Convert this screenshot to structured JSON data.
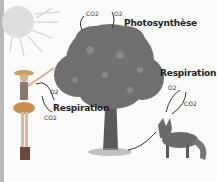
{
  "labels": {
    "photosynthesis": "Photosynthèse",
    "respiration_human": "Respiration",
    "respiration_fox": "Respiration"
  },
  "gases": {
    "tree_in": "CO2",
    "tree_out": "O2",
    "human_in": "O2",
    "human_out": "CO2",
    "fox_in": "O2",
    "fox_out": "CO2"
  },
  "colors": {
    "background": "#fbfbfb",
    "foliage": "#6f6f6f",
    "trunk": "#5a5a5a",
    "sun": "#d8d8d8",
    "fox": "#6a6a6a",
    "arrow": "#333333"
  }
}
